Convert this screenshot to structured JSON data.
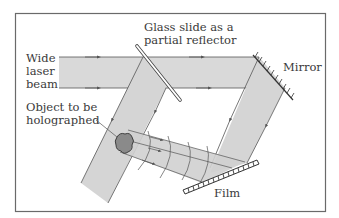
{
  "diagram": {
    "labels": {
      "wide_laser_beam": [
        "Wide",
        "laser",
        "beam"
      ],
      "glass_slide": [
        "Glass slide as a",
        "partial reflector"
      ],
      "mirror": "Mirror",
      "object": [
        "Object to be",
        "holographed"
      ],
      "film": "Film"
    },
    "colors": {
      "frame": "#6a6a6a",
      "beam_fill": "#d9d9d9",
      "beam_edge": "#555555",
      "object_fill": "#8a8a8a",
      "text": "#3a3a3a"
    },
    "components": [
      {
        "id": "laser-beam",
        "type": "beam",
        "direction": "left-to-right"
      },
      {
        "id": "glass-slide",
        "type": "partial-reflector"
      },
      {
        "id": "mirror",
        "type": "mirror"
      },
      {
        "id": "object",
        "type": "object-to-be-holographed"
      },
      {
        "id": "film",
        "type": "photographic-film"
      }
    ]
  }
}
